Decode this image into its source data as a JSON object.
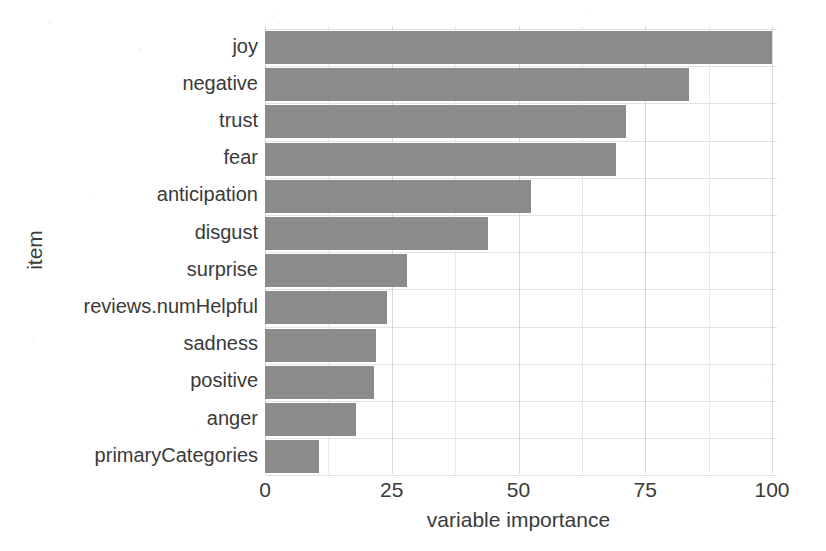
{
  "chart_data": {
    "type": "bar",
    "orientation": "horizontal",
    "title": "",
    "xlabel": "variable importance",
    "ylabel": "item",
    "categories": [
      "joy",
      "negative",
      "trust",
      "fear",
      "anticipation",
      "disgust",
      "surprise",
      "reviews.numHelpful",
      "sadness",
      "positive",
      "anger",
      "primaryCategories"
    ],
    "values": [
      100,
      83.6,
      71.2,
      69.2,
      52.5,
      44.0,
      28.0,
      24.0,
      21.9,
      21.5,
      18.0,
      10.6
    ],
    "xlim": [
      0,
      100
    ],
    "xticks": [
      0,
      25,
      50,
      75,
      100
    ],
    "xtick_labels": [
      "0",
      "25",
      "50",
      "75",
      "100"
    ],
    "grid": true,
    "legend": false,
    "bar_color": "#8b8b8b",
    "background_color": "#ffffff",
    "gridline_color": "#d8d8d8"
  }
}
